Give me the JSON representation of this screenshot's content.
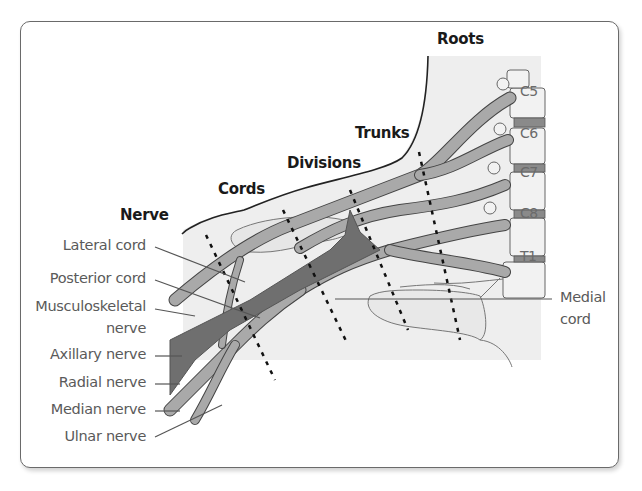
{
  "figure": {
    "regions": {
      "roots": "Roots",
      "trunks": "Trunks",
      "divisions": "Divisions",
      "cords": "Cords",
      "nerve": "Nerve"
    },
    "vertebrae": [
      "C5",
      "C6",
      "C7",
      "C8",
      "T1"
    ],
    "left_labels": [
      {
        "text": "Lateral cord"
      },
      {
        "text": "Posterior cord"
      },
      {
        "text": "Musculoskeletal"
      },
      {
        "text": "nerve"
      },
      {
        "text": "Axillary nerve"
      },
      {
        "text": "Radial nerve"
      },
      {
        "text": "Median nerve"
      },
      {
        "text": "Ulnar nerve"
      }
    ],
    "right_labels": {
      "medial_line1": "Medial",
      "medial_line2": "cord"
    },
    "colors": {
      "frame_border": "#6a6a6a",
      "illustration_bg": "#eeeeee",
      "nerve_light": "#a9a9a9",
      "nerve_dark": "#6f6f6f",
      "outline": "#3a3a3a",
      "label_text": "#5a5a5a",
      "header_text": "#1a1a1a"
    }
  }
}
